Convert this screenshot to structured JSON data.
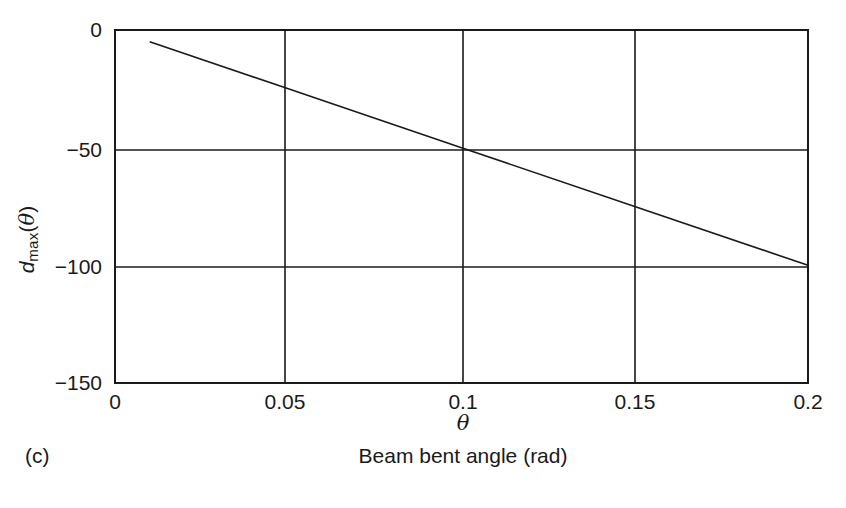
{
  "chart_data": {
    "type": "line",
    "title": "",
    "subtitle": "",
    "xlabel": "θ",
    "ylabel": "d_max(θ)",
    "xlim": [
      0,
      0.2
    ],
    "ylim": [
      -150,
      0
    ],
    "grid": true,
    "legend": null,
    "xticks": [
      0,
      0.05,
      0.1,
      0.15,
      0.2
    ],
    "xticklabels": [
      "0",
      "0.05",
      "0.1",
      "0.15",
      "0.2"
    ],
    "yticks": [
      0,
      -50,
      -100,
      -150
    ],
    "yticklabels": [
      "0",
      "−50",
      "−100",
      "−150"
    ],
    "series": [
      {
        "name": "d_max(θ)",
        "color": "#1a1a1a",
        "linewidth": 1.6,
        "x": [
          0.01,
          0.05,
          0.1,
          0.15,
          0.2
        ],
        "values": [
          -5,
          -25,
          -50,
          -75,
          -100
        ]
      }
    ],
    "annotations": []
  },
  "figure": {
    "panel_letter": "(c)",
    "caption": "Beam bent angle (rad)",
    "x_axis_title_parts": {
      "symbol": "θ"
    },
    "y_axis_title_parts": {
      "base": "d",
      "subscript": "max",
      "argument_open": "(",
      "argument": "θ",
      "argument_close": ")"
    },
    "colors": {
      "axis": "#1a1a1a",
      "line": "#1a1a1a",
      "background": "#ffffff"
    }
  }
}
